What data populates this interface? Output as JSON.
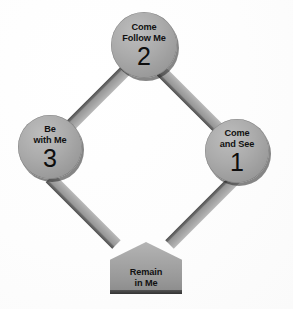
{
  "diagram": {
    "type": "cycle-diagram",
    "background_color": "#ffffff",
    "node_color": "#a5a5a5",
    "connector_color": "#9a9a9a",
    "text_color": "#111111",
    "nodes": [
      {
        "id": "come-and-see",
        "shape": "circle",
        "line1": "Come",
        "line2": "and See",
        "numeral": "1",
        "position": "right"
      },
      {
        "id": "come-follow-me",
        "shape": "circle",
        "line1": "Come",
        "line2": "Follow Me",
        "numeral": "2",
        "position": "top"
      },
      {
        "id": "be-with-me",
        "shape": "circle",
        "line1": "Be",
        "line2": "with Me",
        "numeral": "3",
        "position": "left"
      },
      {
        "id": "remain-in-me",
        "shape": "pentagon",
        "line1": "Remain",
        "line2": "in Me",
        "numeral": "",
        "position": "bottom"
      }
    ],
    "connectors": [
      {
        "id": "top-to-left",
        "from": "come-follow-me",
        "to": "be-with-me"
      },
      {
        "id": "top-to-right",
        "from": "come-follow-me",
        "to": "come-and-see"
      },
      {
        "id": "left-to-bottom",
        "from": "be-with-me",
        "to": "remain-in-me"
      },
      {
        "id": "right-to-bottom",
        "from": "come-and-see",
        "to": "remain-in-me"
      }
    ]
  }
}
